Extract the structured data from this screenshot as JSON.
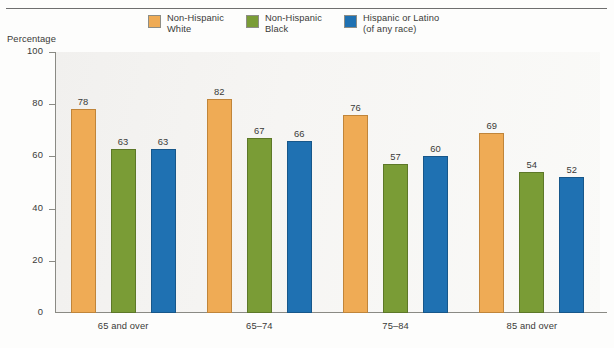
{
  "chart_data": {
    "type": "bar",
    "title": "",
    "xlabel": "",
    "ylabel": "Percentage",
    "ylim": [
      0,
      100
    ],
    "yticks": [
      0,
      20,
      40,
      60,
      80,
      100
    ],
    "grid": false,
    "legend_position": "top-center",
    "categories": [
      "65 and over",
      "65–74",
      "75–84",
      "85 and over"
    ],
    "series": [
      {
        "name": "Non-Hispanic White",
        "legend_label": "Non-Hispanic\nWhite",
        "color": "#efab55",
        "values": [
          78,
          82,
          76,
          69
        ]
      },
      {
        "name": "Non-Hispanic Black",
        "legend_label": "Non-Hispanic\nBlack",
        "color": "#7a9c36",
        "values": [
          63,
          67,
          57,
          54
        ]
      },
      {
        "name": "Hispanic or Latino (of any race)",
        "legend_label": "Hispanic or Latino\n(of any race)",
        "color": "#1f71b2",
        "values": [
          63,
          66,
          60,
          52
        ]
      }
    ]
  }
}
